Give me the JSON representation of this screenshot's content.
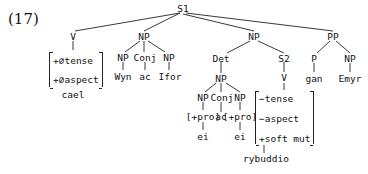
{
  "example_number": "(17)",
  "nodes": {
    "s1": "S1",
    "v1": "V",
    "v1_features": [
      "+∅tense",
      "+∅aspect"
    ],
    "v1_word": "cael",
    "np1": "NP",
    "np1a": "NP",
    "np1a_word": "Wyn",
    "conj1": "Conj",
    "conj1_word": "ac",
    "np1b": "NP",
    "np1b_word": "Ifor",
    "np2": "NP",
    "det": "Det",
    "np_det": "NP",
    "np_det_a": "NP",
    "np_det_a_feature": "[+pro]",
    "np_det_a_word": "ei",
    "conj2": "Conj",
    "conj2_word": "ac",
    "np_det_b": "NP",
    "np_det_b_feature": "[+pro]",
    "np_det_b_word": "ei",
    "s2": "S2",
    "v2": "V",
    "v2_features": [
      "−tense",
      "−aspect",
      "+soft mut"
    ],
    "v2_word": "rybuddio",
    "pp": "PP",
    "p": "P",
    "p_word": "gan",
    "np3": "NP",
    "np3_word": "Emyr"
  }
}
